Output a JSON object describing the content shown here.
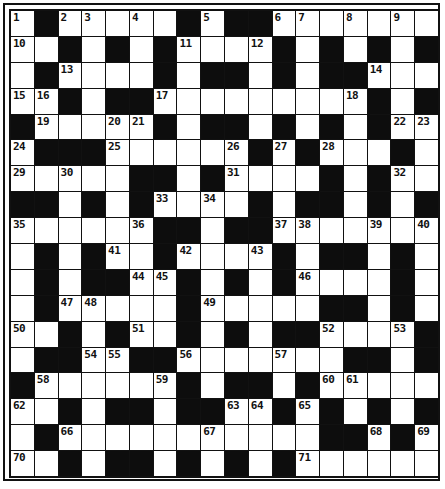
{
  "puzzle": {
    "title": "Crossword grid",
    "rows": 18,
    "cols": 18,
    "colors": {
      "black_cell": "#0d0d0d",
      "white_cell": "#ffffff",
      "border": "#111111"
    },
    "legend": "B = black square, W = blank white square, number = numbered white square",
    "grid": [
      [
        "1",
        "B",
        "2",
        "3",
        "W",
        "4",
        "W",
        "B",
        "5",
        "B",
        "B",
        "6",
        "7",
        "W",
        "8",
        "W",
        "9",
        "W"
      ],
      [
        "10",
        "W",
        "B",
        "W",
        "B",
        "W",
        "B",
        "11",
        "W",
        "W",
        "12",
        "B",
        "W",
        "B",
        "W",
        "B",
        "W",
        "B"
      ],
      [
        "W",
        "B",
        "13",
        "W",
        "W",
        "W",
        "B",
        "W",
        "B",
        "B",
        "W",
        "B",
        "W",
        "B",
        "B",
        "14",
        "W",
        "W"
      ],
      [
        "15",
        "16",
        "B",
        "W",
        "B",
        "B",
        "17",
        "W",
        "W",
        "W",
        "W",
        "W",
        "W",
        "W",
        "18",
        "B",
        "W",
        "B"
      ],
      [
        "B",
        "19",
        "W",
        "W",
        "20",
        "21",
        "B",
        "W",
        "B",
        "B",
        "W",
        "B",
        "W",
        "B",
        "W",
        "B",
        "22",
        "23"
      ],
      [
        "24",
        "B",
        "B",
        "B",
        "25",
        "W",
        "W",
        "W",
        "W",
        "26",
        "B",
        "27",
        "B",
        "28",
        "W",
        "W",
        "B",
        "W"
      ],
      [
        "29",
        "W",
        "30",
        "W",
        "W",
        "B",
        "B",
        "W",
        "B",
        "31",
        "W",
        "W",
        "W",
        "B",
        "W",
        "B",
        "32",
        "W"
      ],
      [
        "B",
        "B",
        "W",
        "B",
        "W",
        "B",
        "33",
        "W",
        "34",
        "W",
        "B",
        "W",
        "B",
        "B",
        "W",
        "B",
        "W",
        "B"
      ],
      [
        "35",
        "W",
        "W",
        "W",
        "W",
        "36",
        "B",
        "B",
        "W",
        "B",
        "B",
        "37",
        "38",
        "W",
        "W",
        "39",
        "W",
        "40"
      ],
      [
        "W",
        "B",
        "W",
        "B",
        "41",
        "W",
        "B",
        "42",
        "W",
        "W",
        "43",
        "B",
        "W",
        "B",
        "B",
        "W",
        "B",
        "W"
      ],
      [
        "W",
        "B",
        "W",
        "B",
        "B",
        "44",
        "45",
        "B",
        "W",
        "B",
        "W",
        "B",
        "46",
        "W",
        "W",
        "W",
        "B",
        "W"
      ],
      [
        "W",
        "B",
        "47",
        "48",
        "W",
        "W",
        "W",
        "B",
        "49",
        "W",
        "W",
        "W",
        "W",
        "B",
        "B",
        "W",
        "B",
        "W"
      ],
      [
        "50",
        "W",
        "B",
        "W",
        "B",
        "51",
        "W",
        "B",
        "W",
        "B",
        "W",
        "B",
        "B",
        "52",
        "W",
        "W",
        "53",
        "B"
      ],
      [
        "W",
        "B",
        "B",
        "54",
        "55",
        "B",
        "B",
        "56",
        "W",
        "W",
        "W",
        "57",
        "W",
        "W",
        "B",
        "B",
        "W",
        "B"
      ],
      [
        "B",
        "58",
        "W",
        "W",
        "W",
        "W",
        "59",
        "B",
        "W",
        "B",
        "B",
        "W",
        "B",
        "60",
        "61",
        "W",
        "W",
        "W"
      ],
      [
        "62",
        "W",
        "B",
        "W",
        "B",
        "B",
        "W",
        "B",
        "B",
        "63",
        "64",
        "B",
        "65",
        "B",
        "W",
        "B",
        "W",
        "B"
      ],
      [
        "W",
        "B",
        "66",
        "W",
        "W",
        "W",
        "W",
        "W",
        "67",
        "W",
        "W",
        "W",
        "W",
        "B",
        "B",
        "68",
        "B",
        "69"
      ],
      [
        "70",
        "W",
        "B",
        "W",
        "B",
        "B",
        "W",
        "B",
        "W",
        "B",
        "W",
        "B",
        "71",
        "W",
        "W",
        "W",
        "W",
        "W"
      ]
    ]
  }
}
